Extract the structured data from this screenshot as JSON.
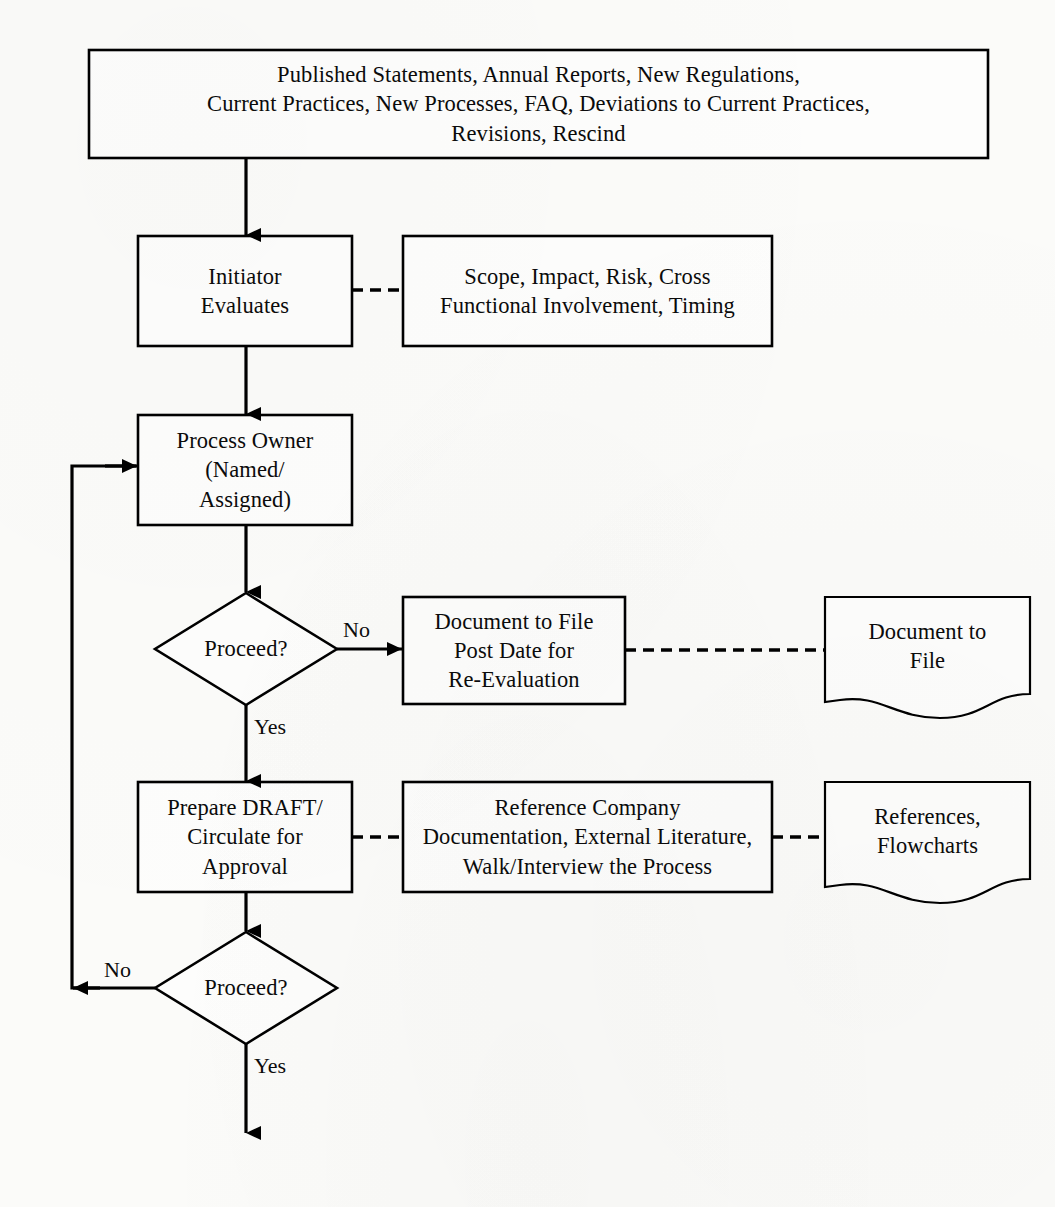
{
  "diagram": {
    "type": "flowchart",
    "page_background": "#fbfbf9",
    "line_color": "#000000",
    "text_color": "#0b0b0b"
  },
  "nodes": {
    "source_inputs": {
      "shape": "process-box",
      "lines": [
        "Published Statements, Annual Reports, New Regulations,",
        "Current Practices, New Processes, FAQ, Deviations to Current Practices,",
        "Revisions, Rescind"
      ]
    },
    "initiator_evaluates": {
      "shape": "process-box",
      "lines": [
        "Initiator",
        "Evaluates"
      ]
    },
    "initiator_criteria": {
      "shape": "annotation-box",
      "lines": [
        "Scope, Impact, Risk, Cross",
        "Functional Involvement, Timing"
      ]
    },
    "process_owner": {
      "shape": "process-box",
      "lines": [
        "Process Owner",
        "(Named/",
        "Assigned)"
      ]
    },
    "decision_one": {
      "shape": "decision-diamond",
      "lines": [
        "Proceed?"
      ]
    },
    "document_to_file_action": {
      "shape": "process-box",
      "lines": [
        "Document to File",
        "Post Date for",
        "Re-Evaluation"
      ]
    },
    "document_to_file_artifact": {
      "shape": "document",
      "lines": [
        "Document to",
        "File"
      ]
    },
    "prepare_draft": {
      "shape": "process-box",
      "lines": [
        "Prepare DRAFT/",
        "Circulate for",
        "Approval"
      ]
    },
    "draft_criteria": {
      "shape": "annotation-box",
      "lines": [
        "Reference Company",
        "Documentation, External Literature,",
        "Walk/Interview the Process"
      ]
    },
    "references_artifact": {
      "shape": "document",
      "lines": [
        "References,",
        "Flowcharts"
      ]
    },
    "decision_two": {
      "shape": "decision-diamond",
      "lines": [
        "Proceed?"
      ]
    }
  },
  "edge_labels": {
    "decision_one_no": "No",
    "decision_one_yes": "Yes",
    "decision_two_no": "No",
    "decision_two_yes": "Yes"
  }
}
